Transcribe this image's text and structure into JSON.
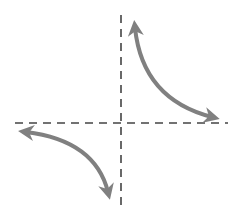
{
  "diagram": {
    "colors": {
      "background": "#ffffff",
      "asymptote": "#444444",
      "curve": "#808080"
    },
    "asymptotes": {
      "vertical": {
        "x": 121,
        "y1": 15,
        "y2": 205
      },
      "horizontal": {
        "y": 123,
        "x1": 15,
        "x2": 228
      }
    },
    "branches": [
      {
        "name": "upper-right",
        "path": "M 135 28 C 140 75, 165 105, 212 117"
      },
      {
        "name": "lower-left",
        "path": "M 26 132 C 75 138, 100 160, 108 192"
      }
    ]
  }
}
